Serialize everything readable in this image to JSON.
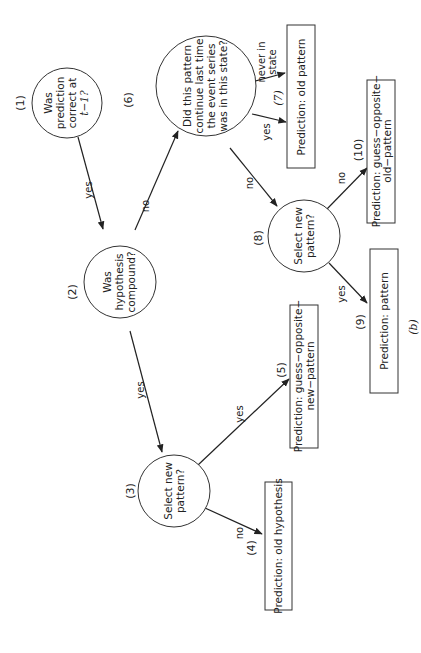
{
  "figure": {
    "caption": "(b)",
    "orientation": "rotated 90° counter-clockwise",
    "nodes": [
      {
        "id": "1",
        "number": "(1)",
        "type": "decision",
        "lines": [
          "Was",
          "prediction",
          "correct at",
          "t−1?"
        ]
      },
      {
        "id": "2",
        "number": "(2)",
        "type": "decision",
        "lines": [
          "Was",
          "hypothesis",
          "compound?"
        ]
      },
      {
        "id": "3",
        "number": "(3)",
        "type": "decision",
        "lines": [
          "Select new",
          "pattern?"
        ]
      },
      {
        "id": "4",
        "number": "(4)",
        "type": "outcome",
        "lines": [
          "Prediction: old hypothesis"
        ]
      },
      {
        "id": "5",
        "number": "(5)",
        "type": "outcome",
        "lines": [
          "Prediction: guess−opposite−",
          "new−pattern"
        ]
      },
      {
        "id": "6",
        "number": "(6)",
        "type": "decision",
        "lines": [
          "Did this pattern",
          "continue last time",
          "the event series",
          "was in this state?"
        ]
      },
      {
        "id": "7",
        "number": "(7)",
        "type": "outcome",
        "lines": [
          "Prediction: old pattern"
        ]
      },
      {
        "id": "8",
        "number": "(8)",
        "type": "decision",
        "lines": [
          "Select new",
          "pattern?"
        ]
      },
      {
        "id": "9",
        "number": "(9)",
        "type": "outcome",
        "lines": [
          "Prediction: pattern"
        ]
      },
      {
        "id": "10",
        "number": "(10)",
        "type": "outcome",
        "lines": [
          "Prediction: guess−opposite−",
          "old−pattern"
        ]
      }
    ],
    "edges": [
      {
        "from": "1",
        "to": "2",
        "label": "yes"
      },
      {
        "from": "2",
        "to": "3",
        "label": "yes"
      },
      {
        "from": "2",
        "to": "6",
        "label": "no"
      },
      {
        "from": "3",
        "to": "4",
        "label": "no"
      },
      {
        "from": "3",
        "to": "5",
        "label": "yes"
      },
      {
        "from": "6",
        "to": "7",
        "label": "never in state",
        "label_lines": [
          "never in",
          "state"
        ]
      },
      {
        "from": "6",
        "to": "7",
        "label": "yes"
      },
      {
        "from": "6",
        "to": "8",
        "label": "no"
      },
      {
        "from": "8",
        "to": "9",
        "label": "yes"
      },
      {
        "from": "8",
        "to": "10",
        "label": "no"
      }
    ]
  }
}
